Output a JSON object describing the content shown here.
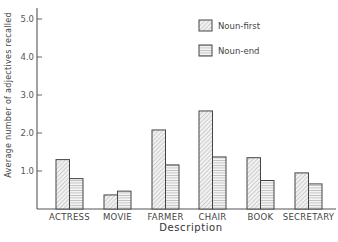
{
  "chart_data": {
    "type": "bar",
    "title": "",
    "xlabel": "Description",
    "ylabel": "Average number of adjectives recalled",
    "categories": [
      "ACTRESS",
      "MOVIE",
      "FARMER",
      "CHAIR",
      "BOOK",
      "SECRETARY"
    ],
    "series": [
      {
        "name": "Noun-first",
        "values": [
          1.3,
          0.37,
          2.08,
          2.58,
          1.35,
          0.95
        ],
        "pattern": "diagonal-hatch"
      },
      {
        "name": "Noun-end",
        "values": [
          0.8,
          0.47,
          1.16,
          1.37,
          0.75,
          0.66
        ],
        "pattern": "horizontal-hatch"
      }
    ],
    "yticks": [
      "1.0",
      "2.0",
      "3.0",
      "4.0",
      "5.0"
    ],
    "ylim": [
      0,
      5.2
    ],
    "grid": false,
    "legend_position": "top-right-inside"
  },
  "colors": {
    "axis": "#555555",
    "bar_stroke": "#444444",
    "hatch": "#9a9a9a"
  }
}
